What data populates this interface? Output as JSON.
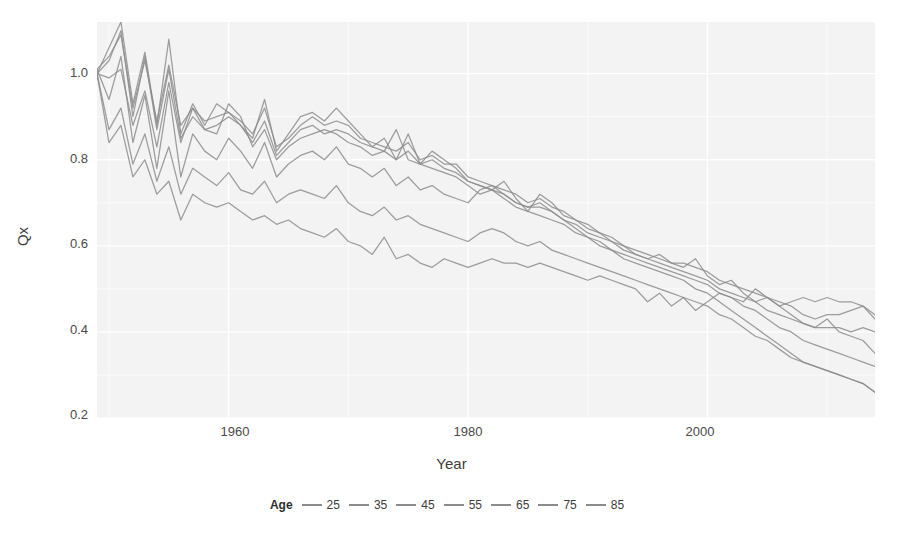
{
  "chart_data": {
    "type": "line",
    "title": "",
    "xlabel": "Year",
    "ylabel": "Qx",
    "xlim": [
      1949,
      2014
    ],
    "ylim": [
      0.2,
      1.12
    ],
    "xticks": [
      1960,
      1980,
      2000
    ],
    "xtick_labels": [
      "1960",
      "1980",
      "2000"
    ],
    "yticks": [
      0.2,
      0.4,
      0.6,
      0.8,
      1.0
    ],
    "ytick_labels": [
      "0.2",
      "0.4",
      "0.6",
      "0.8",
      "1.0"
    ],
    "grid": true,
    "legend_position": "bottom",
    "legend_title": "Age",
    "panel_background": "#f3f3f3",
    "grid_color": "#ffffff",
    "line_color": "#8c8c8c",
    "x": [
      1949,
      1950,
      1951,
      1952,
      1953,
      1954,
      1955,
      1956,
      1957,
      1958,
      1959,
      1960,
      1961,
      1962,
      1963,
      1964,
      1965,
      1966,
      1967,
      1968,
      1969,
      1970,
      1971,
      1972,
      1973,
      1974,
      1975,
      1976,
      1977,
      1978,
      1979,
      1980,
      1981,
      1982,
      1983,
      1984,
      1985,
      1986,
      1987,
      1988,
      1989,
      1990,
      1991,
      1992,
      1993,
      1994,
      1995,
      1996,
      1997,
      1998,
      1999,
      2000,
      2001,
      2002,
      2003,
      2004,
      2005,
      2006,
      2007,
      2008,
      2009,
      2010,
      2011,
      2012,
      2013,
      2014
    ],
    "series": [
      {
        "name": "25",
        "label": "25",
        "color": "#8c8c8c",
        "values": [
          1.0,
          1.06,
          1.12,
          0.93,
          1.05,
          0.88,
          1.08,
          0.86,
          0.93,
          0.88,
          0.93,
          0.91,
          0.88,
          0.85,
          0.94,
          0.82,
          0.86,
          0.9,
          0.91,
          0.89,
          0.92,
          0.89,
          0.86,
          0.83,
          0.85,
          0.8,
          0.86,
          0.79,
          0.82,
          0.8,
          0.78,
          0.75,
          0.74,
          0.73,
          0.75,
          0.71,
          0.68,
          0.72,
          0.7,
          0.67,
          0.66,
          0.65,
          0.63,
          0.62,
          0.6,
          0.58,
          0.57,
          0.58,
          0.56,
          0.55,
          0.57,
          0.53,
          0.51,
          0.52,
          0.49,
          0.47,
          0.48,
          0.46,
          0.44,
          0.42,
          0.41,
          0.43,
          0.4,
          0.39,
          0.38,
          0.35
        ]
      },
      {
        "name": "35",
        "label": "35",
        "color": "#8c8c8c",
        "values": [
          1.01,
          1.04,
          1.09,
          0.92,
          1.03,
          0.89,
          1.02,
          0.88,
          0.92,
          0.89,
          0.9,
          0.91,
          0.89,
          0.86,
          0.92,
          0.83,
          0.85,
          0.88,
          0.9,
          0.88,
          0.89,
          0.88,
          0.85,
          0.84,
          0.83,
          0.82,
          0.84,
          0.8,
          0.81,
          0.79,
          0.79,
          0.76,
          0.75,
          0.74,
          0.73,
          0.72,
          0.7,
          0.71,
          0.69,
          0.68,
          0.66,
          0.64,
          0.63,
          0.61,
          0.6,
          0.59,
          0.58,
          0.57,
          0.56,
          0.56,
          0.55,
          0.54,
          0.52,
          0.51,
          0.5,
          0.49,
          0.48,
          0.47,
          0.46,
          0.44,
          0.43,
          0.44,
          0.44,
          0.45,
          0.46,
          0.44
        ]
      },
      {
        "name": "45",
        "label": "45",
        "color": "#8c8c8c",
        "values": [
          1.0,
          1.03,
          1.1,
          0.9,
          1.04,
          0.87,
          1.01,
          0.85,
          0.9,
          0.87,
          0.88,
          0.9,
          0.88,
          0.84,
          0.89,
          0.81,
          0.84,
          0.87,
          0.88,
          0.86,
          0.87,
          0.86,
          0.84,
          0.83,
          0.82,
          0.8,
          0.82,
          0.79,
          0.8,
          0.78,
          0.77,
          0.75,
          0.74,
          0.73,
          0.72,
          0.7,
          0.69,
          0.69,
          0.68,
          0.66,
          0.65,
          0.63,
          0.62,
          0.61,
          0.59,
          0.58,
          0.57,
          0.56,
          0.55,
          0.54,
          0.53,
          0.52,
          0.5,
          0.49,
          0.48,
          0.47,
          0.45,
          0.44,
          0.43,
          0.42,
          0.41,
          0.41,
          0.41,
          0.4,
          0.41,
          0.4
        ]
      },
      {
        "name": "55",
        "label": "55",
        "color": "#8c8c8c",
        "values": [
          1.0,
          0.99,
          1.01,
          0.88,
          0.96,
          0.83,
          0.98,
          0.84,
          0.92,
          0.87,
          0.86,
          0.93,
          0.9,
          0.83,
          0.87,
          0.8,
          0.83,
          0.85,
          0.86,
          0.87,
          0.86,
          0.84,
          0.83,
          0.81,
          0.82,
          0.87,
          0.8,
          0.79,
          0.78,
          0.77,
          0.76,
          0.74,
          0.72,
          0.73,
          0.71,
          0.69,
          0.68,
          0.67,
          0.66,
          0.65,
          0.63,
          0.62,
          0.61,
          0.59,
          0.58,
          0.57,
          0.56,
          0.55,
          0.54,
          0.53,
          0.52,
          0.51,
          0.49,
          0.48,
          0.46,
          0.45,
          0.43,
          0.41,
          0.4,
          0.38,
          0.37,
          0.36,
          0.35,
          0.34,
          0.33,
          0.32
        ]
      },
      {
        "name": "65",
        "label": "65",
        "color": "#8c8c8c",
        "values": [
          1.01,
          0.94,
          1.04,
          0.84,
          0.95,
          0.78,
          0.96,
          0.76,
          0.86,
          0.82,
          0.8,
          0.85,
          0.82,
          0.78,
          0.84,
          0.76,
          0.79,
          0.81,
          0.82,
          0.8,
          0.83,
          0.79,
          0.78,
          0.76,
          0.78,
          0.74,
          0.76,
          0.73,
          0.74,
          0.72,
          0.71,
          0.7,
          0.73,
          0.74,
          0.72,
          0.7,
          0.69,
          0.7,
          0.68,
          0.66,
          0.64,
          0.62,
          0.6,
          0.59,
          0.57,
          0.56,
          0.55,
          0.54,
          0.53,
          0.52,
          0.5,
          0.49,
          0.47,
          0.45,
          0.43,
          0.41,
          0.39,
          0.37,
          0.35,
          0.33,
          0.32,
          0.31,
          0.3,
          0.29,
          0.28,
          0.26
        ]
      },
      {
        "name": "75",
        "label": "75",
        "color": "#8c8c8c",
        "values": [
          1.0,
          0.87,
          0.92,
          0.79,
          0.86,
          0.75,
          0.83,
          0.72,
          0.78,
          0.76,
          0.74,
          0.77,
          0.73,
          0.72,
          0.75,
          0.7,
          0.72,
          0.73,
          0.72,
          0.71,
          0.74,
          0.7,
          0.68,
          0.67,
          0.69,
          0.66,
          0.67,
          0.65,
          0.64,
          0.63,
          0.62,
          0.61,
          0.63,
          0.64,
          0.63,
          0.61,
          0.6,
          0.61,
          0.59,
          0.58,
          0.57,
          0.56,
          0.55,
          0.54,
          0.53,
          0.52,
          0.51,
          0.5,
          0.49,
          0.48,
          0.47,
          0.46,
          0.44,
          0.43,
          0.41,
          0.39,
          0.38,
          0.36,
          0.34,
          0.33,
          0.32,
          0.31,
          0.3,
          0.29,
          0.28,
          0.26
        ]
      },
      {
        "name": "85",
        "label": "85",
        "color": "#8c8c8c",
        "values": [
          1.0,
          0.84,
          0.88,
          0.76,
          0.8,
          0.72,
          0.75,
          0.66,
          0.72,
          0.7,
          0.69,
          0.7,
          0.68,
          0.66,
          0.67,
          0.65,
          0.66,
          0.64,
          0.63,
          0.62,
          0.64,
          0.61,
          0.6,
          0.58,
          0.62,
          0.57,
          0.58,
          0.56,
          0.55,
          0.57,
          0.56,
          0.55,
          0.56,
          0.57,
          0.56,
          0.56,
          0.55,
          0.56,
          0.55,
          0.54,
          0.53,
          0.52,
          0.53,
          0.52,
          0.51,
          0.5,
          0.47,
          0.49,
          0.46,
          0.48,
          0.45,
          0.47,
          0.49,
          0.48,
          0.47,
          0.5,
          0.48,
          0.46,
          0.47,
          0.48,
          0.47,
          0.48,
          0.47,
          0.47,
          0.46,
          0.43
        ]
      }
    ]
  }
}
